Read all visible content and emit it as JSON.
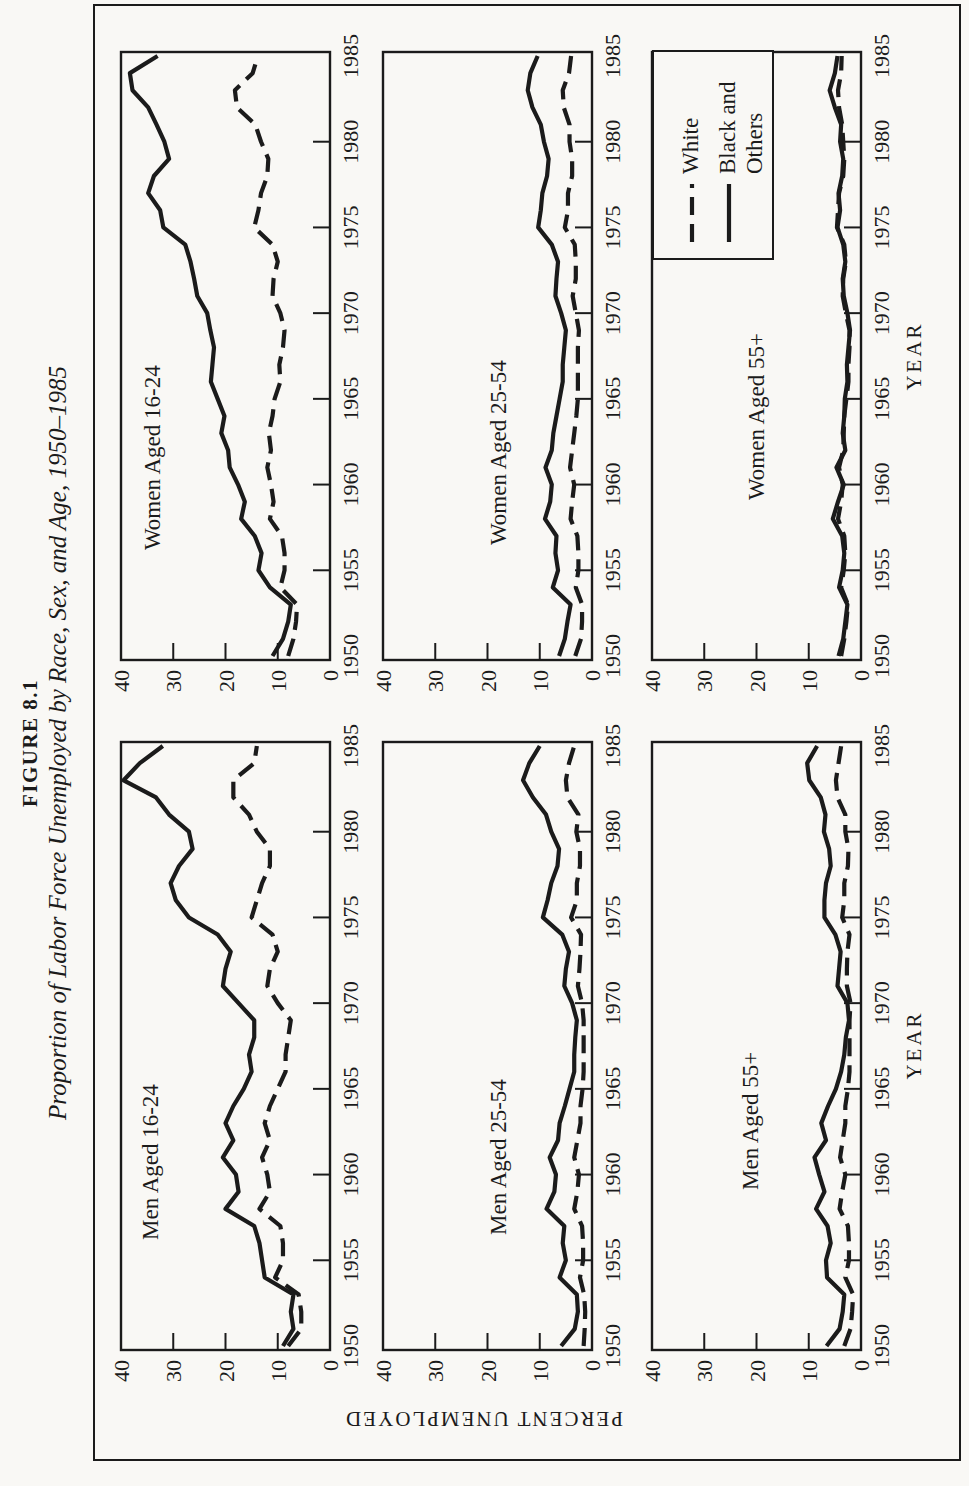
{
  "title": {
    "figure_label": "FIGURE 8.1",
    "subtitle": "Proportion of Labor Force Unemployed by Race, Sex, and Age, 1950–1985"
  },
  "axes": {
    "y_label": "PERCENT UNEMPLOYED",
    "x_label": "YEAR",
    "y_ticks": [
      0,
      10,
      20,
      30,
      40
    ],
    "x_tick_years": [
      1950,
      1955,
      1960,
      1965,
      1970,
      1975,
      1980,
      1985
    ],
    "y_range": [
      0,
      40
    ],
    "x_range": [
      1950,
      1985
    ]
  },
  "legend": {
    "entries": [
      {
        "label": "White",
        "style": "dashed"
      },
      {
        "label": "Black and Others",
        "style": "solid",
        "lines": [
          "Black and",
          "Others"
        ]
      }
    ]
  },
  "colors": {
    "ink": "#1b1b1b",
    "paper": "#f9f8f5"
  },
  "chart_data": {
    "type": "line",
    "years": [
      1950,
      1951,
      1952,
      1953,
      1954,
      1955,
      1956,
      1957,
      1958,
      1959,
      1960,
      1961,
      1962,
      1963,
      1964,
      1965,
      1966,
      1967,
      1968,
      1969,
      1970,
      1971,
      1972,
      1973,
      1974,
      1975,
      1976,
      1977,
      1978,
      1979,
      1980,
      1981,
      1982,
      1983,
      1984,
      1985
    ],
    "ylim": [
      0,
      40
    ],
    "grid": false,
    "legend_position": "inside bottom-right panel",
    "panels": [
      {
        "label": "Men Aged 16-24",
        "series": [
          {
            "name": "White",
            "dash": true,
            "values": [
              8,
              5.5,
              5.5,
              6,
              10.5,
              9,
              9,
              9.5,
              13.5,
              11.5,
              12,
              13,
              11.5,
              12.5,
              11.5,
              10,
              8.5,
              8.5,
              8,
              7.5,
              10,
              12,
              11.5,
              10,
              11,
              15,
              14,
              13,
              11.5,
              11.5,
              14,
              15.5,
              18.5,
              18.5,
              14.5,
              14
            ]
          },
          {
            "name": "Black and Others",
            "dash": false,
            "values": [
              9,
              7,
              7.5,
              7,
              12.5,
              13,
              13.5,
              14.5,
              20,
              17.5,
              18,
              20.5,
              18.5,
              20,
              18.5,
              16.5,
              15,
              15.5,
              14.5,
              14.5,
              17.5,
              20.5,
              20,
              19,
              21.5,
              27,
              29.5,
              30.5,
              28.9,
              26.3,
              27,
              30.8,
              33.3,
              39.5,
              36.4,
              32
            ]
          }
        ]
      },
      {
        "label": "Women Aged 16-24",
        "series": [
          {
            "name": "White",
            "dash": true,
            "values": [
              8,
              7,
              6.5,
              6.3,
              9.5,
              8.7,
              8.7,
              9.2,
              11.5,
              10.8,
              11.3,
              12,
              11.3,
              11.7,
              11,
              10.6,
              9.5,
              9.7,
              9,
              8.7,
              9.5,
              11,
              10.8,
              10,
              11,
              14.5,
              13.7,
              13.2,
              12,
              11.8,
              13.2,
              14.3,
              17.8,
              18.2,
              14.8,
              13.8
            ]
          },
          {
            "name": "Black and Others",
            "dash": false,
            "values": [
              11,
              9,
              8,
              7.5,
              11.5,
              13.7,
              13.1,
              14.4,
              17,
              16.3,
              17.6,
              19.2,
              19.5,
              20.8,
              20.2,
              21.5,
              22.8,
              22.5,
              22.2,
              22.9,
              23.5,
              25.4,
              26,
              26.7,
              27.7,
              31.9,
              32.5,
              34.8,
              33.7,
              30.8,
              31.7,
              33.2,
              34.8,
              37.8,
              38.3,
              33
            ]
          }
        ]
      },
      {
        "label": "Men Aged 25-54",
        "series": [
          {
            "name": "White",
            "dash": true,
            "values": [
              1.6,
              1.4,
              1.3,
              1.5,
              2.3,
              1.7,
              1.7,
              1.9,
              3.4,
              2.8,
              2.5,
              3.4,
              2.8,
              2.2,
              2.2,
              1.8,
              1.6,
              1.6,
              1.6,
              1.6,
              1.9,
              2.7,
              2.4,
              2.2,
              2.1,
              4,
              2.9,
              2.9,
              2.3,
              2.3,
              3,
              2.6,
              4.7,
              5,
              4.4,
              3.4
            ]
          },
          {
            "name": "Black and Others",
            "dash": false,
            "values": [
              5.9,
              3.3,
              2.7,
              2.9,
              6.2,
              5,
              5.6,
              5.3,
              8.7,
              7.2,
              6.9,
              8.1,
              6.5,
              6.2,
              5.2,
              4.3,
              3.4,
              3.4,
              3.2,
              2.9,
              3.8,
              5.3,
              5,
              4.4,
              5.7,
              9.4,
              8.5,
              7.8,
              6.6,
              6.3,
              7.8,
              8.8,
              11.3,
              13.2,
              12,
              10
            ]
          }
        ]
      },
      {
        "label": "Women Aged 25-54",
        "series": [
          {
            "name": "White",
            "dash": true,
            "values": [
              3.2,
              2.1,
              1.9,
              1.9,
              3.1,
              2.6,
              2.6,
              2.8,
              4.1,
              3.8,
              3.4,
              4.2,
              3.8,
              3.4,
              3,
              2.7,
              2.7,
              2.7,
              2.7,
              2.5,
              3.1,
              3.7,
              3.1,
              3.1,
              3.3,
              5.2,
              4.6,
              4.6,
              3.8,
              3.8,
              4.3,
              4.3,
              5.4,
              5.6,
              4.4,
              4
            ]
          },
          {
            "name": "Black and Others",
            "dash": false,
            "values": [
              6.3,
              5.2,
              4.7,
              4.1,
              7.5,
              6.5,
              7,
              6.8,
              9,
              8,
              7.7,
              8.9,
              7.7,
              7.4,
              6.8,
              6.2,
              5.6,
              5.6,
              5.3,
              5,
              5.9,
              7,
              6.8,
              6.5,
              7.7,
              10.3,
              9.8,
              9.5,
              8.6,
              8.3,
              9.2,
              9.8,
              11.4,
              12.3,
              11.8,
              10.4
            ]
          }
        ]
      },
      {
        "label": "Men Aged 55+",
        "series": [
          {
            "name": "White",
            "dash": true,
            "values": [
              3.2,
              2,
              1.7,
              1.5,
              3,
              2.3,
              2.3,
              2.5,
              4.1,
              3.6,
              3,
              4,
              3.5,
              3,
              3,
              2.5,
              2.2,
              2.2,
              2.2,
              2.2,
              2,
              2.7,
              2.7,
              2.6,
              2.2,
              3.6,
              3.2,
              3.2,
              2.5,
              2.4,
              3,
              3,
              4.5,
              4.8,
              4.3,
              3.8
            ]
          },
          {
            "name": "Black and Others",
            "dash": false,
            "values": [
              6.6,
              4.1,
              3.5,
              3.2,
              6.5,
              6.7,
              5.8,
              6.4,
              8.6,
              7,
              8,
              8.9,
              6.7,
              7.6,
              6.3,
              4.8,
              3.8,
              3.2,
              2.9,
              2.3,
              2.6,
              4.5,
              4.2,
              3.9,
              4.9,
              7,
              7,
              6.7,
              5.8,
              6.1,
              7.1,
              6.8,
              7.7,
              9.9,
              10.3,
              8.4
            ]
          }
        ]
      },
      {
        "label": "Women Aged 55+",
        "series": [
          {
            "name": "White",
            "dash": true,
            "values": [
              3.8,
              3.2,
              2.8,
              2.5,
              3.8,
              3.3,
              3,
              3.2,
              4.4,
              3.8,
              3.5,
              4.2,
              3.4,
              3.3,
              3.2,
              2.8,
              2.4,
              2.4,
              2.2,
              2.2,
              2.9,
              3.5,
              3.4,
              2.9,
              3.2,
              4.6,
              4.4,
              4.2,
              3.4,
              3.2,
              3.4,
              3.6,
              4.2,
              4.4,
              3.8,
              3.7
            ]
          },
          {
            "name": "Black and Others",
            "dash": false,
            "values": [
              4.3,
              3.4,
              3,
              2.6,
              4.2,
              3.5,
              3.2,
              3.6,
              5.4,
              4.4,
              3.3,
              4.7,
              3,
              3.5,
              3.2,
              3.1,
              2.6,
              2.7,
              2.4,
              2.1,
              2.6,
              3.3,
              3.5,
              3,
              3.4,
              4.5,
              4,
              4.3,
              3.6,
              3.4,
              4,
              3.8,
              5,
              6,
              5,
              4.5
            ]
          }
        ]
      }
    ]
  }
}
